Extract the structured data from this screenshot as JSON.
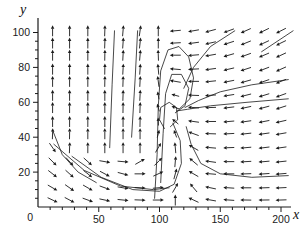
{
  "figure": {
    "xlabel": "x",
    "ylabel": "y"
  },
  "chart_data": {
    "type": "quiver",
    "title": "",
    "xlabel": "x",
    "ylabel": "y",
    "xlim": [
      0,
      210
    ],
    "ylim": [
      0,
      105
    ],
    "x_ticks": [
      50,
      100,
      150,
      200
    ],
    "y_ticks": [
      20,
      40,
      60,
      80,
      100
    ],
    "x_minor_step": 10,
    "y_minor_step": 5,
    "origin_label": "0",
    "legend": null,
    "grid": false,
    "ink_color": "#1a1a1a",
    "equilibrium_point": [
      108,
      53
    ],
    "arrow_grid_x": [
      12,
      26,
      41,
      55,
      70,
      84,
      99,
      113,
      128,
      142,
      157,
      171,
      186,
      200
    ],
    "arrow_rows": [
      {
        "y": 101,
        "angles": [
          90,
          90,
          90,
          88,
          85,
          82,
          90,
          185,
          190,
          195,
          200,
          204,
          206,
          207
        ]
      },
      {
        "y": 94,
        "angles": [
          90,
          90,
          90,
          88,
          86,
          84,
          90,
          183,
          188,
          193,
          198,
          202,
          205,
          206
        ]
      },
      {
        "y": 87,
        "angles": [
          90,
          90,
          90,
          89,
          87,
          85,
          92,
          180,
          185,
          190,
          196,
          200,
          203,
          205
        ]
      },
      {
        "y": 79,
        "angles": [
          90,
          90,
          90,
          89,
          87,
          86,
          95,
          175,
          183,
          188,
          193,
          198,
          201,
          204
        ]
      },
      {
        "y": 72,
        "angles": [
          90,
          90,
          90,
          89,
          88,
          87,
          97,
          170,
          180,
          186,
          191,
          196,
          199,
          202
        ]
      },
      {
        "y": 64,
        "angles": [
          90,
          90,
          90,
          90,
          88,
          87,
          100,
          165,
          178,
          184,
          189,
          194,
          197,
          200
        ]
      },
      {
        "y": 57,
        "angles": [
          90,
          90,
          90,
          90,
          89,
          88,
          105,
          160,
          176,
          182,
          187,
          192,
          195,
          198
        ]
      },
      {
        "y": 49,
        "angles": [
          90,
          90,
          90,
          90,
          90,
          89,
          92,
          140,
          172,
          180,
          185,
          188,
          191,
          193
        ]
      },
      {
        "y": 42,
        "angles": [
          88,
          89,
          90,
          90,
          90,
          90,
          75,
          110,
          160,
          178,
          183,
          186,
          188,
          190
        ]
      },
      {
        "y": 34,
        "angles": [
          -55,
          88,
          90,
          90,
          90,
          90,
          60,
          95,
          150,
          175,
          182,
          185,
          187,
          188
        ]
      },
      {
        "y": 26,
        "angles": [
          -45,
          -48,
          -42,
          -10,
          -5,
          30,
          45,
          85,
          140,
          172,
          180,
          183,
          185,
          186
        ]
      },
      {
        "y": 19,
        "angles": [
          -38,
          -42,
          -38,
          -28,
          -15,
          0,
          25,
          75,
          150,
          175,
          180,
          182,
          184,
          185
        ]
      },
      {
        "y": 11,
        "angles": [
          -30,
          -35,
          -30,
          -20,
          -10,
          -3,
          5,
          60,
          130,
          168,
          176,
          180,
          182,
          183
        ]
      },
      {
        "y": 4,
        "angles": [
          -25,
          -28,
          -20,
          -12,
          -6,
          -2,
          0,
          90,
          155,
          170,
          176,
          179,
          181,
          182
        ]
      }
    ],
    "streamlines": [
      [
        [
          96,
          5
        ],
        [
          98,
          30
        ],
        [
          99,
          58
        ],
        [
          101,
          78
        ],
        [
          107,
          90
        ],
        [
          116,
          92
        ],
        [
          124,
          86
        ],
        [
          128,
          74
        ],
        [
          125,
          62
        ],
        [
          116,
          56
        ]
      ],
      [
        [
          101,
          14
        ],
        [
          103,
          42
        ],
        [
          105,
          65
        ],
        [
          110,
          76
        ],
        [
          118,
          76
        ],
        [
          124,
          68
        ],
        [
          121,
          58
        ],
        [
          113,
          54
        ]
      ],
      [
        [
          206,
          62
        ],
        [
          172,
          60
        ],
        [
          142,
          58
        ],
        [
          123,
          56
        ],
        [
          114,
          55
        ]
      ],
      [
        [
          206,
          73
        ],
        [
          176,
          70
        ],
        [
          150,
          66
        ],
        [
          132,
          61
        ],
        [
          121,
          57
        ]
      ],
      [
        [
          28,
          29
        ],
        [
          52,
          17
        ],
        [
          78,
          10
        ],
        [
          100,
          9
        ],
        [
          112,
          13
        ],
        [
          118,
          25
        ],
        [
          117,
          38
        ],
        [
          111,
          48
        ]
      ],
      [
        [
          13,
          36
        ],
        [
          38,
          21
        ],
        [
          68,
          12
        ],
        [
          95,
          10
        ],
        [
          108,
          11
        ]
      ],
      [
        [
          206,
          18
        ],
        [
          176,
          17
        ],
        [
          150,
          19
        ],
        [
          134,
          25
        ],
        [
          126,
          36
        ],
        [
          122,
          46
        ]
      ],
      [
        [
          59,
          34
        ],
        [
          61,
          70
        ],
        [
          63,
          101
        ]
      ],
      [
        [
          77,
          40
        ],
        [
          80,
          74
        ],
        [
          82,
          101
        ]
      ],
      [
        [
          162,
          101
        ],
        [
          142,
          92
        ],
        [
          128,
          80
        ],
        [
          120,
          68
        ]
      ],
      [
        [
          210,
          101
        ],
        [
          184,
          89
        ]
      ],
      [
        [
          12,
          44
        ],
        [
          20,
          30
        ],
        [
          33,
          20
        ],
        [
          48,
          14
        ]
      ],
      [
        [
          104,
          45
        ],
        [
          100,
          50
        ],
        [
          101,
          57
        ],
        [
          108,
          60
        ],
        [
          114,
          57
        ],
        [
          115,
          50
        ],
        [
          109,
          46
        ]
      ]
    ]
  }
}
